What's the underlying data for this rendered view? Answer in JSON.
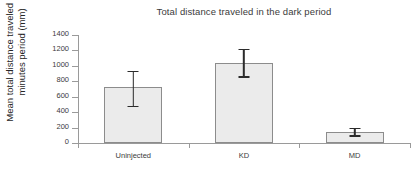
{
  "chart_data": {
    "type": "bar",
    "title": "Total distance traveled in the dark period",
    "xlabel": "",
    "ylabel_line1": "Mean total distance traveled in to",
    "ylabel_line2": "minutes period (mm)",
    "categories": [
      "Uninjected",
      "KD",
      "MD"
    ],
    "values": [
      725,
      1035,
      140
    ],
    "errors_upper": [
      935,
      1225,
      200
    ],
    "errors_lower": [
      465,
      845,
      80
    ],
    "yticks": [
      0,
      200,
      400,
      600,
      800,
      1000,
      1200,
      1400
    ],
    "ylim": [
      0,
      1400
    ],
    "grid": false,
    "legend": "none",
    "bar_fill": "#ebebeb",
    "bar_border": "#8c8c8c",
    "error_color": "#2b2b2b",
    "axis_color": "#9a9a9a"
  }
}
